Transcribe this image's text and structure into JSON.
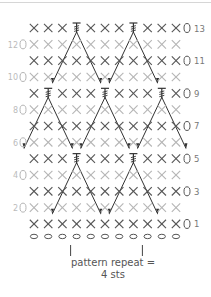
{
  "diagram": {
    "type": "crochet-stitch-chart",
    "columns": 11,
    "rows": [
      {
        "row": 13,
        "side": "right",
        "label": "13",
        "stitches": [
          "X",
          "X",
          "X",
          "T",
          "X",
          "X",
          "X",
          "T",
          "X",
          "X",
          "X"
        ],
        "shade": "dark"
      },
      {
        "row": 12,
        "side": "left",
        "label": "12",
        "stitches": [
          "X",
          "X",
          "X",
          "X",
          "X",
          "X",
          "X",
          "X",
          "X",
          "X",
          "X"
        ],
        "shade": "light"
      },
      {
        "row": 11,
        "side": "right",
        "label": "11",
        "stitches": [
          "X",
          "X",
          "X",
          "X",
          "X",
          "X",
          "X",
          "X",
          "X",
          "X",
          "X"
        ],
        "shade": "dark"
      },
      {
        "row": 10,
        "side": "left",
        "label": "10",
        "stitches": [
          "X",
          "X",
          "X",
          "X",
          "X",
          "X",
          "X",
          "X",
          "X",
          "X",
          "X"
        ],
        "shade": "light"
      },
      {
        "row": 9,
        "side": "right",
        "label": "9",
        "stitches": [
          "X",
          "T",
          "X",
          "X",
          "X",
          "T",
          "X",
          "X",
          "X",
          "T",
          "X"
        ],
        "shade": "dark"
      },
      {
        "row": 8,
        "side": "left",
        "label": "8",
        "stitches": [
          "X",
          "X",
          "X",
          "X",
          "X",
          "X",
          "X",
          "X",
          "X",
          "X",
          "X"
        ],
        "shade": "light"
      },
      {
        "row": 7,
        "side": "right",
        "label": "7",
        "stitches": [
          "X",
          "X",
          "X",
          "X",
          "X",
          "X",
          "X",
          "X",
          "X",
          "X",
          "X"
        ],
        "shade": "dark"
      },
      {
        "row": 6,
        "side": "left",
        "label": "6",
        "stitches": [
          "X",
          "X",
          "X",
          "X",
          "X",
          "X",
          "X",
          "X",
          "X",
          "X",
          "X"
        ],
        "shade": "light"
      },
      {
        "row": 5,
        "side": "right",
        "label": "5",
        "stitches": [
          "X",
          "X",
          "X",
          "T",
          "X",
          "X",
          "X",
          "T",
          "X",
          "X",
          "X"
        ],
        "shade": "dark"
      },
      {
        "row": 4,
        "side": "left",
        "label": "4",
        "stitches": [
          "X",
          "X",
          "X",
          "X",
          "X",
          "X",
          "X",
          "X",
          "X",
          "X",
          "X"
        ],
        "shade": "light"
      },
      {
        "row": 3,
        "side": "right",
        "label": "3",
        "stitches": [
          "X",
          "X",
          "X",
          "X",
          "X",
          "X",
          "X",
          "X",
          "X",
          "X",
          "X"
        ],
        "shade": "dark"
      },
      {
        "row": 2,
        "side": "left",
        "label": "2",
        "stitches": [
          "X",
          "X",
          "X",
          "X",
          "X",
          "X",
          "X",
          "X",
          "X",
          "X",
          "X"
        ],
        "shade": "light"
      },
      {
        "row": 1,
        "side": "right",
        "label": "1",
        "stitches": [
          "X",
          "X",
          "X",
          "X",
          "X",
          "X",
          "X",
          "X",
          "X",
          "X",
          "X"
        ],
        "shade": "dark"
      }
    ],
    "foundation_chain": {
      "count": 11,
      "symbol": "O"
    },
    "turning_chain_symbol": "O",
    "stitch_legend": {
      "X": "single crochet",
      "O": "chain",
      "T": "long spike stitch worked down"
    },
    "repeat": {
      "label_line1": "pattern repeat =",
      "label_line2": "4 sts",
      "start_col": 3,
      "end_col": 7
    },
    "colors": {
      "dark": "#555555",
      "light": "#b5b5b5",
      "line": "#333333",
      "label": "#777777"
    }
  }
}
